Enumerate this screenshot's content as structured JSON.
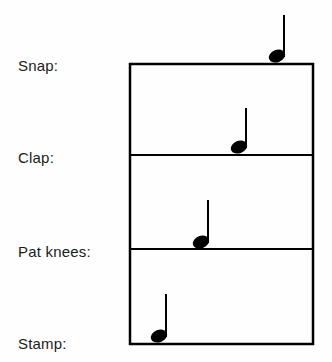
{
  "figure": {
    "kind": "rhythm-notation-chart",
    "background_color": "#fefefe",
    "ink_color": "#000000",
    "width": 332,
    "height": 362
  },
  "staff": {
    "box": {
      "left": 130,
      "top": 64,
      "right": 313,
      "bottom": 344
    },
    "border_width": 2.5,
    "divider_width": 2.0,
    "dividers_y": [
      155,
      249
    ]
  },
  "rows": [
    {
      "id": "snap",
      "label": "Snap:",
      "label_x": 18,
      "label_baseline_y": 70,
      "line_y": 64,
      "note": {
        "glyph": "quarter-note",
        "head_cx": 277,
        "head_cy": 56,
        "head_rx": 8.5,
        "head_ry": 6.2,
        "head_rotation_deg": -22,
        "stem_x": 284,
        "stem_top_y": 15,
        "stem_bottom_y": 57,
        "stem_width": 2
      }
    },
    {
      "id": "clap",
      "label": "Clap:",
      "label_x": 18,
      "label_baseline_y": 162,
      "line_y": 155,
      "note": {
        "glyph": "quarter-note",
        "head_cx": 239,
        "head_cy": 147,
        "head_rx": 8.5,
        "head_ry": 6.2,
        "head_rotation_deg": -22,
        "stem_x": 246,
        "stem_top_y": 108,
        "stem_bottom_y": 148,
        "stem_width": 2
      }
    },
    {
      "id": "pat-knees",
      "label": "Pat knees:",
      "label_x": 18,
      "label_baseline_y": 256,
      "line_y": 249,
      "note": {
        "glyph": "quarter-note",
        "head_cx": 201,
        "head_cy": 242,
        "head_rx": 8.5,
        "head_ry": 6.2,
        "head_rotation_deg": -22,
        "stem_x": 208,
        "stem_top_y": 200,
        "stem_bottom_y": 243,
        "stem_width": 2
      }
    },
    {
      "id": "stamp",
      "label": "Stamp:",
      "label_x": 18,
      "label_baseline_y": 348,
      "line_y": 344,
      "note": {
        "glyph": "quarter-note",
        "head_cx": 159,
        "head_cy": 336,
        "head_rx": 8.5,
        "head_ry": 6.2,
        "head_rotation_deg": -22,
        "stem_x": 166,
        "stem_top_y": 294,
        "stem_bottom_y": 337,
        "stem_width": 2
      }
    }
  ]
}
